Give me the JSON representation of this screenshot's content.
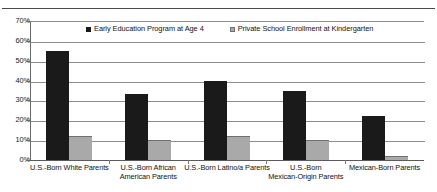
{
  "chart_data": {
    "type": "bar",
    "title": "",
    "xlabel": "",
    "ylabel": "",
    "ylim": [
      0,
      70
    ],
    "ytick_labels": [
      "70%",
      "60%",
      "50%",
      "40%",
      "30%",
      "20%",
      "10%",
      "0%"
    ],
    "ytick_values": [
      70,
      60,
      50,
      40,
      30,
      20,
      10,
      0
    ],
    "grid": true,
    "legend_position": "top-center",
    "categories": [
      "U.S.-Born White Parents",
      "U.S.-Born African American Parents",
      "U.S.-Born Latino/a Parents",
      "U.S.-Born Mexican-Origin Parents",
      "Mexican-Born Parents"
    ],
    "category_lines": [
      [
        "U.S.-Born White Parents"
      ],
      [
        "U.S.-Born African",
        "American Parents"
      ],
      [
        "U.S.-Born Latino/a Parents"
      ],
      [
        "U.S.-Born",
        "Mexican-Origin Parents"
      ],
      [
        "Mexican-Born Parents"
      ]
    ],
    "series": [
      {
        "name": "Early Education Program at Age 4",
        "color": "#1a1a1a",
        "values": [
          55,
          33,
          40,
          35,
          22
        ]
      },
      {
        "name": "Private School Enrollment at Kindergarten",
        "color": "#a9a9a9",
        "values": [
          12,
          10,
          12,
          10,
          2
        ]
      }
    ]
  },
  "legend": {
    "items": [
      {
        "label": "Early Education Program at Age 4"
      },
      {
        "label": "Private School Enrollment at Kindergarten"
      }
    ]
  }
}
